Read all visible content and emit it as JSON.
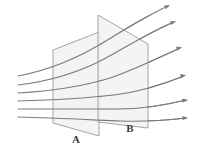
{
  "figure": {
    "kind": "flux-through-surfaces-diagram",
    "background_color": "#ffffff",
    "line_color": "#7d7d7d",
    "plane_fill_color": "#f2f2f2",
    "plane_stroke_color": "#9a9a9a",
    "label_color": "#3a3a3a"
  },
  "planes": [
    {
      "id": "plane-a",
      "label": "A",
      "label_x": 76,
      "label_y": 143,
      "points": "53,50 99,32 99,136 53,123",
      "description": "near parallelogram surface, smaller, left"
    },
    {
      "id": "plane-b",
      "label": "B",
      "label_x": 130,
      "label_y": 132,
      "points": "98,15 148,44 148,128 98,122",
      "description": "far parallelogram surface, larger, right"
    }
  ],
  "field_lines": [
    {
      "id": "field-line-1",
      "path": "M 18,76 C 50,70 78,58 104,42 C 124,30 146,16 168,6",
      "arrow_x": 170,
      "arrow_y": 5,
      "arrow_angle": -26
    },
    {
      "id": "field-line-2",
      "path": "M 18,85 C 52,81 80,72 106,58 C 128,46 150,32 174,22",
      "arrow_x": 176,
      "arrow_y": 21,
      "arrow_angle": -22
    },
    {
      "id": "field-line-3",
      "path": "M 18,93 C 54,91 84,86 110,78 C 134,70 158,58 180,48",
      "arrow_x": 182,
      "arrow_y": 47,
      "arrow_angle": -18
    },
    {
      "id": "field-line-4",
      "path": "M 18,101 C 56,100 88,98 114,95 C 140,92 164,84 184,76",
      "arrow_x": 186,
      "arrow_y": 75,
      "arrow_angle": -12
    },
    {
      "id": "field-line-5",
      "path": "M 18,109 C 58,109 92,109 118,109 C 144,109 166,105 186,100",
      "arrow_x": 188,
      "arrow_y": 100,
      "arrow_angle": -6
    },
    {
      "id": "field-line-6",
      "path": "M 18,117 C 58,118 94,120 120,121 C 146,122 168,120 186,118",
      "arrow_x": 188,
      "arrow_y": 118,
      "arrow_angle": -2
    }
  ]
}
